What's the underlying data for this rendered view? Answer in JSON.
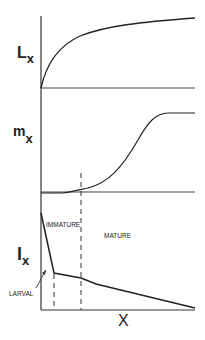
{
  "panels": {
    "top": {
      "ylabel_main": "L",
      "ylabel_sub": "x"
    },
    "middle": {
      "ylabel_main": "m",
      "ylabel_sub": "x"
    },
    "bottom": {
      "ylabel_main": "l",
      "ylabel_sub": "x",
      "stage_labels": {
        "immature": "IMMATURE",
        "mature": "MATURE",
        "larval": "LARVAL"
      }
    }
  },
  "xlabel": "X",
  "colors": {
    "line": "#222222",
    "axis": "#333333",
    "background": "#ffffff"
  }
}
